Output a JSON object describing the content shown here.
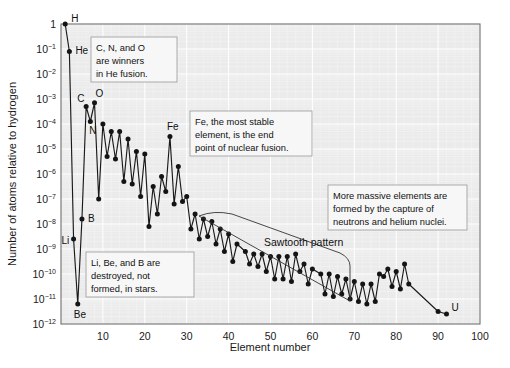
{
  "chart_data": {
    "type": "line",
    "title": "",
    "xlabel": "Element number",
    "ylabel": "Number of atoms relative to hydrogen",
    "xlim": [
      0,
      100
    ],
    "ylim_log10": [
      -12,
      0
    ],
    "grid": true,
    "legend": null,
    "x_ticks": [
      10,
      20,
      30,
      40,
      50,
      60,
      70,
      80,
      90,
      100
    ],
    "y_ticks_log10": [
      0,
      -1,
      -2,
      -3,
      -4,
      -5,
      -6,
      -7,
      -8,
      -9,
      -10,
      -11,
      -12
    ],
    "y_tick_labels": [
      "1",
      "10-1",
      "10-2",
      "10-3",
      "10-4",
      "10-5",
      "10-6",
      "10-7",
      "10-8",
      "10-9",
      "10-10",
      "10-11",
      "10-12"
    ],
    "x": [
      1,
      2,
      3,
      4,
      5,
      6,
      7,
      8,
      9,
      10,
      11,
      12,
      13,
      14,
      15,
      16,
      17,
      18,
      19,
      20,
      21,
      22,
      23,
      24,
      25,
      26,
      27,
      28,
      29,
      30,
      31,
      32,
      33,
      34,
      35,
      36,
      37,
      38,
      39,
      40,
      41,
      42,
      44,
      45,
      46,
      47,
      48,
      49,
      50,
      51,
      52,
      53,
      54,
      55,
      56,
      57,
      58,
      59,
      60,
      62,
      63,
      64,
      65,
      66,
      67,
      68,
      69,
      70,
      71,
      72,
      73,
      74,
      75,
      76,
      77,
      78,
      79,
      80,
      81,
      82,
      83,
      90,
      92
    ],
    "y_log10": [
      0,
      -1.1,
      -8.6,
      -11.2,
      -7.8,
      -3.3,
      -3.9,
      -3.15,
      -7.0,
      -4.0,
      -5.3,
      -4.3,
      -5.4,
      -4.3,
      -6.3,
      -4.6,
      -6.4,
      -5.1,
      -6.9,
      -5.2,
      -8.1,
      -6.5,
      -7.6,
      -6.1,
      -6.7,
      -4.5,
      -7.2,
      -5.7,
      -7.1,
      -6.9,
      -8.2,
      -7.6,
      -8.6,
      -7.8,
      -8.5,
      -7.9,
      -8.8,
      -8.2,
      -9.1,
      -8.4,
      -9.5,
      -8.8,
      -9.1,
      -9.6,
      -9.2,
      -9.7,
      -9.2,
      -9.9,
      -9.3,
      -10.2,
      -9.3,
      -10.2,
      -9.3,
      -10.3,
      -9.2,
      -9.9,
      -9.6,
      -10.4,
      -9.8,
      -10.0,
      -10.8,
      -10.0,
      -10.9,
      -10.1,
      -10.8,
      -10.2,
      -11.0,
      -10.3,
      -11.1,
      -10.4,
      -11.2,
      -10.4,
      -11.1,
      -10.0,
      -10.1,
      -9.8,
      -10.5,
      -9.9,
      -10.6,
      -9.6,
      -10.4,
      -11.5,
      -11.6
    ],
    "element_labels": [
      {
        "symbol": "H",
        "element_number": 1,
        "y_log10": 0
      },
      {
        "symbol": "He",
        "element_number": 2,
        "y_log10": -1.1
      },
      {
        "symbol": "Li",
        "element_number": 3,
        "y_log10": -8.6
      },
      {
        "symbol": "Be",
        "element_number": 4,
        "y_log10": -11.2
      },
      {
        "symbol": "B",
        "element_number": 5,
        "y_log10": -7.8
      },
      {
        "symbol": "C",
        "element_number": 6,
        "y_log10": -3.3
      },
      {
        "symbol": "N",
        "element_number": 7,
        "y_log10": -3.9
      },
      {
        "symbol": "O",
        "element_number": 8,
        "y_log10": -3.15
      },
      {
        "symbol": "Fe",
        "element_number": 26,
        "y_log10": -4.5
      },
      {
        "symbol": "U",
        "element_number": 92,
        "y_log10": -11.6
      }
    ],
    "annotations": [
      {
        "name": "sawtooth-pattern",
        "text": "Sawtooth pattern"
      },
      {
        "name": "he-fusion-callout",
        "lines": [
          "C, N, and O",
          "are winners",
          "in He fusion."
        ]
      },
      {
        "name": "fe-stability-callout",
        "lines": [
          "Fe, the most stable",
          "element, is the end",
          "point of nuclear fusion."
        ]
      },
      {
        "name": "massive-elements-callout",
        "lines": [
          "More massive elements are",
          "formed by the capture of",
          "neutrons and helium nuclei."
        ]
      },
      {
        "name": "libeb-destroyed-callout",
        "lines": [
          "Li, Be, and B are",
          "destroyed, not",
          "formed, in stars."
        ]
      }
    ],
    "colors": {
      "line": "#1a1a1a",
      "point": "#141414",
      "plot_background": "#ebebeb",
      "grid": "#ffffff",
      "callout_background": "#f7f7f7"
    }
  }
}
